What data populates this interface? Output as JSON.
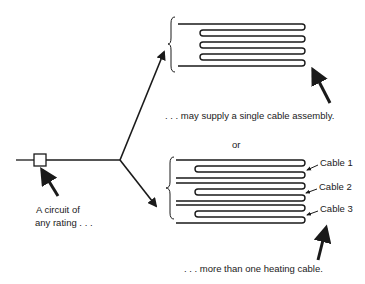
{
  "diagram": {
    "type": "heating-cable-circuit-schematic",
    "labels": {
      "circuit_line1": "A circuit of",
      "circuit_line2": "any rating . . .",
      "single_assembly": ". . . may supply a single  cable assembly.",
      "or": "or",
      "multi_cable": ". . . more than one  heating cable."
    },
    "cables": [
      {
        "label": "Cable 1"
      },
      {
        "label": "Cable 2"
      },
      {
        "label": "Cable 3"
      }
    ],
    "colors": {
      "stroke": "#1a1a1a",
      "background": "#ffffff"
    }
  }
}
